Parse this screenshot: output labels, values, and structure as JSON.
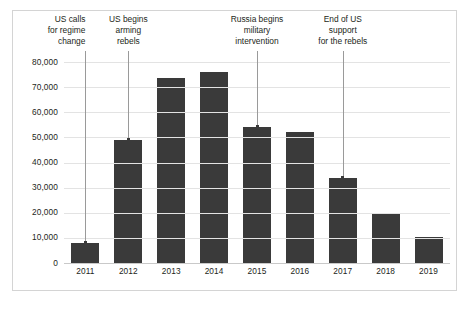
{
  "chart_data": {
    "type": "bar",
    "title": "",
    "subtitle": "",
    "xlabel": "",
    "ylabel": "",
    "categories": [
      "2011",
      "2012",
      "2013",
      "2014",
      "2015",
      "2016",
      "2017",
      "2018",
      "2019"
    ],
    "values": [
      8000,
      49000,
      73500,
      76000,
      54000,
      52000,
      34000,
      20000,
      10500
    ],
    "ylim": [
      0,
      80000
    ],
    "y_ticks": [
      80000,
      70000,
      60000,
      50000,
      40000,
      30000,
      20000,
      10000,
      0
    ],
    "y_tick_labels": [
      "80,000",
      "70,000",
      "60,000",
      "50,000",
      "40,000",
      "30,000",
      "20,000",
      "10,000",
      "0"
    ],
    "grid": true,
    "legend": false,
    "legend_position": "none",
    "bar_color": "#3a3a3a",
    "grid_color": "#e3e3e3",
    "frame_color": "#d4d4d4",
    "annotations": [
      {
        "text": "US calls\nfor regime\nchange",
        "target_category": "2011",
        "align": "right"
      },
      {
        "text": "US begins\narming\nrebels",
        "target_category": "2012",
        "align": "center"
      },
      {
        "text": "Russia begins\nmilitary\nintervention",
        "target_category": "2015",
        "align": "center"
      },
      {
        "text": "End of US\nsupport\nfor the rebels",
        "target_category": "2017",
        "align": "center"
      }
    ]
  }
}
